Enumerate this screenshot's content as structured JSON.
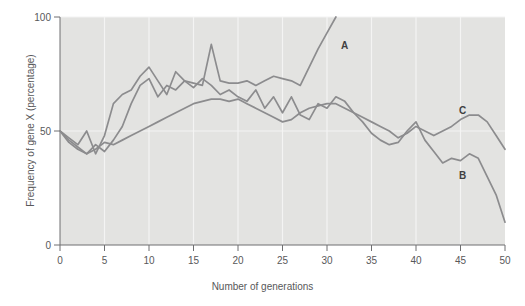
{
  "chart_data": {
    "type": "line",
    "title": "",
    "xlabel": "Number of generations",
    "ylabel": "Frequency of gene X (percentage)",
    "xlim": [
      0,
      50
    ],
    "ylim": [
      0,
      100
    ],
    "xticks": [
      0,
      5,
      10,
      15,
      20,
      25,
      30,
      35,
      40,
      45,
      50
    ],
    "yticks": [
      0,
      50,
      100
    ],
    "xticklabels": [
      "0",
      "5",
      "10",
      "15",
      "20",
      "25",
      "30",
      "35",
      "40",
      "45",
      "50"
    ],
    "yticklabels": [
      "0",
      "50",
      "100"
    ],
    "grid": "vertical-and-horizontal-white-gridlines",
    "legend": "inline-end-labels",
    "plot_background": "#e3e3e1",
    "line_color": "#8c8c8e",
    "series": [
      {
        "name": "A",
        "label": "A",
        "color": "#8c8c8e",
        "x": [
          0,
          1,
          2,
          3,
          4,
          5,
          6,
          7,
          8,
          9,
          10,
          11,
          12,
          13,
          14,
          15,
          16,
          17,
          18,
          19,
          20,
          21,
          22,
          23,
          24,
          25,
          26,
          27,
          28,
          29,
          30,
          31
        ],
        "values": [
          50,
          45,
          42,
          40,
          44,
          41,
          46,
          52,
          62,
          70,
          73,
          65,
          70,
          68,
          72,
          71,
          70,
          88,
          72,
          71,
          71,
          72,
          70,
          72,
          74,
          73,
          72,
          70,
          78,
          86,
          93,
          100
        ]
      },
      {
        "name": "B",
        "label": "B",
        "color": "#8c8c8e",
        "x": [
          0,
          1,
          2,
          3,
          4,
          5,
          6,
          7,
          8,
          9,
          10,
          11,
          12,
          13,
          14,
          15,
          16,
          17,
          18,
          19,
          20,
          21,
          22,
          23,
          24,
          25,
          26,
          27,
          28,
          29,
          30,
          31,
          32,
          33,
          34,
          35,
          36,
          37,
          38,
          39,
          40,
          41,
          42,
          43,
          44,
          45,
          46,
          47,
          48,
          49,
          50
        ],
        "values": [
          50,
          47,
          44,
          50,
          40,
          48,
          62,
          66,
          68,
          74,
          78,
          72,
          66,
          76,
          72,
          69,
          73,
          70,
          66,
          68,
          65,
          63,
          68,
          60,
          65,
          58,
          65,
          57,
          55,
          62,
          60,
          65,
          63,
          58,
          54,
          49,
          46,
          44,
          45,
          50,
          54,
          46,
          41,
          36,
          38,
          37,
          40,
          38,
          30,
          22,
          10
        ]
      },
      {
        "name": "C",
        "label": "C",
        "color": "#8c8c8e",
        "x": [
          0,
          1,
          2,
          3,
          4,
          5,
          6,
          7,
          8,
          9,
          10,
          11,
          12,
          13,
          14,
          15,
          16,
          17,
          18,
          19,
          20,
          21,
          22,
          23,
          24,
          25,
          26,
          27,
          28,
          29,
          30,
          31,
          32,
          33,
          34,
          35,
          36,
          37,
          38,
          39,
          40,
          41,
          42,
          43,
          44,
          45,
          46,
          47,
          48,
          49,
          50
        ],
        "values": [
          50,
          46,
          43,
          40,
          42,
          45,
          44,
          46,
          48,
          50,
          52,
          54,
          56,
          58,
          60,
          62,
          63,
          64,
          64,
          63,
          64,
          62,
          60,
          58,
          56,
          54,
          55,
          58,
          60,
          61,
          62,
          62,
          60,
          58,
          56,
          54,
          52,
          50,
          47,
          49,
          52,
          50,
          48,
          50,
          52,
          55,
          57,
          57,
          54,
          48,
          42
        ]
      }
    ],
    "series_label_positions": [
      {
        "name": "A",
        "x_px": 341,
        "y_px": 40
      },
      {
        "name": "C",
        "x_px": 459,
        "y_px": 105
      },
      {
        "name": "B",
        "x_px": 459,
        "y_px": 170
      }
    ]
  }
}
